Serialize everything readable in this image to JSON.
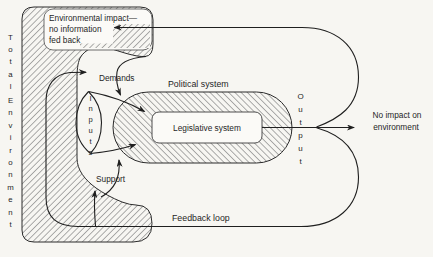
{
  "colors": {
    "background": "#f7f6f2",
    "ink": "#1f1f1f",
    "hatch_line": "#6e6e6e"
  },
  "diagram": {
    "total_environment": {
      "word1": "Total",
      "word2": "Environment"
    },
    "impact_note": {
      "line1": "Environmental impact—",
      "line2": "no information",
      "line3": "fed back"
    },
    "demands_label": "Demands",
    "inputs_label": "Inputs",
    "support_label": "Support",
    "political_label": "Political system",
    "legislative_label": "Legislative system",
    "output_label": "Output",
    "no_impact": {
      "line1": "No impact on",
      "line2": "environment"
    },
    "feedback_label": "Feedback loop"
  }
}
